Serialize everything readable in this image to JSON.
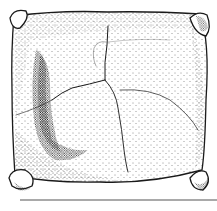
{
  "figure": {
    "colors": {
      "ink": "#1a1a1a",
      "background": "#ffffff",
      "scale_bar": "#555555"
    },
    "scale_bar": {
      "visible": true,
      "text": ""
    }
  }
}
